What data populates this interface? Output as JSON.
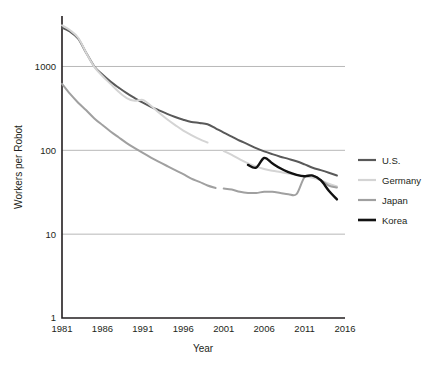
{
  "chart_data": {
    "type": "line",
    "title": "",
    "xlabel": "Year",
    "ylabel": "Workers per Robot",
    "xlim": [
      1981,
      2016
    ],
    "ylim": [
      1,
      4000
    ],
    "yscale": "log",
    "grid": "horizontal-only",
    "legend_position": "right",
    "xticks": [
      "1981",
      "1986",
      "1991",
      "1996",
      "2001",
      "2006",
      "2011",
      "2016"
    ],
    "xtick_values": [
      1981,
      1986,
      1991,
      1996,
      2001,
      2006,
      2011,
      2016
    ],
    "yticks": [
      "1",
      "10",
      "100",
      "1000"
    ],
    "ytick_values": [
      1,
      10,
      100,
      1000
    ],
    "series": [
      {
        "name": "U.S.",
        "color": "#595959",
        "width": 2.0,
        "points": [
          [
            1981,
            2900
          ],
          [
            1982,
            2600
          ],
          [
            1983,
            2150
          ],
          [
            1984,
            1450
          ],
          [
            1985,
            1000
          ],
          [
            1986,
            800
          ],
          [
            1987,
            660
          ],
          [
            1988,
            560
          ],
          [
            1989,
            480
          ],
          [
            1990,
            420
          ],
          [
            1991,
            370
          ],
          [
            1992,
            330
          ],
          [
            1993,
            300
          ],
          [
            1994,
            272
          ],
          [
            1995,
            250
          ],
          [
            1996,
            232
          ],
          [
            1997,
            218
          ],
          [
            1998,
            212
          ],
          [
            1999,
            205
          ],
          [
            2000,
            183
          ],
          [
            2001,
            163
          ],
          [
            2002,
            146
          ],
          [
            2003,
            130
          ],
          [
            2004,
            118
          ],
          [
            2005,
            106
          ],
          [
            2006,
            97
          ],
          [
            2007,
            90
          ],
          [
            2008,
            84
          ],
          [
            2009,
            79
          ],
          [
            2010,
            74
          ],
          [
            2011,
            68
          ],
          [
            2012,
            62
          ],
          [
            2013,
            58
          ],
          [
            2014,
            54
          ],
          [
            2015,
            50
          ]
        ]
      },
      {
        "name": "Germany",
        "color": "#d4d4d4",
        "width": 2.0,
        "segments": [
          [
            [
              1981,
              3100
            ],
            [
              1982,
              2700
            ],
            [
              1983,
              2200
            ],
            [
              1984,
              1450
            ],
            [
              1985,
              990
            ],
            [
              1986,
              770
            ],
            [
              1987,
              620
            ],
            [
              1988,
              500
            ],
            [
              1989,
              420
            ],
            [
              1990,
              390
            ],
            [
              1991,
              400
            ],
            [
              1992,
              340
            ],
            [
              1993,
              280
            ],
            [
              1994,
              235
            ],
            [
              1995,
              200
            ],
            [
              1996,
              172
            ],
            [
              1997,
              152
            ],
            [
              1998,
              136
            ],
            [
              1999,
              124
            ]
          ],
          [
            [
              2001,
              98
            ],
            [
              2002,
              88
            ],
            [
              2003,
              78
            ],
            [
              2004,
              70
            ],
            [
              2005,
              64
            ],
            [
              2006,
              60
            ],
            [
              2007,
              57
            ],
            [
              2008,
              55
            ],
            [
              2009,
              53
            ],
            [
              2010,
              51
            ],
            [
              2011,
              49
            ],
            [
              2012,
              47
            ],
            [
              2013,
              44
            ],
            [
              2014,
              40
            ],
            [
              2015,
              37
            ]
          ]
        ]
      },
      {
        "name": "Japan",
        "color": "#a0a0a0",
        "width": 2.0,
        "segments": [
          [
            [
              1981,
              620
            ],
            [
              1982,
              470
            ],
            [
              1983,
              370
            ],
            [
              1984,
              300
            ],
            [
              1985,
              240
            ],
            [
              1986,
              200
            ],
            [
              1987,
              168
            ],
            [
              1988,
              143
            ],
            [
              1989,
              122
            ],
            [
              1990,
              106
            ],
            [
              1991,
              93
            ],
            [
              1992,
              82
            ],
            [
              1993,
              73
            ],
            [
              1994,
              65
            ],
            [
              1995,
              58
            ],
            [
              1996,
              52
            ],
            [
              1997,
              46
            ],
            [
              1998,
              42
            ],
            [
              1999,
              38
            ],
            [
              2000,
              35.5
            ]
          ],
          [
            [
              2001,
              35
            ],
            [
              2002,
              34
            ],
            [
              2003,
              32
            ],
            [
              2004,
              31
            ],
            [
              2005,
              31
            ],
            [
              2006,
              32
            ],
            [
              2007,
              32
            ],
            [
              2008,
              31
            ],
            [
              2009,
              30
            ],
            [
              2010,
              30
            ],
            [
              2011,
              48
            ],
            [
              2012,
              50
            ],
            [
              2013,
              44
            ],
            [
              2014,
              38
            ],
            [
              2015,
              36
            ]
          ]
        ]
      },
      {
        "name": "Korea",
        "color": "#111111",
        "width": 2.4,
        "points": [
          [
            2004,
            67
          ],
          [
            2005,
            62
          ],
          [
            2006,
            81
          ],
          [
            2007,
            70
          ],
          [
            2008,
            61
          ],
          [
            2009,
            55
          ],
          [
            2010,
            51
          ],
          [
            2011,
            49
          ],
          [
            2012,
            50
          ],
          [
            2013,
            44
          ],
          [
            2014,
            33
          ],
          [
            2015,
            26
          ]
        ]
      }
    ]
  },
  "legend": {
    "items": [
      {
        "label": "U.S.",
        "color": "#595959"
      },
      {
        "label": "Germany",
        "color": "#d4d4d4"
      },
      {
        "label": "Japan",
        "color": "#a0a0a0"
      },
      {
        "label": "Korea",
        "color": "#111111"
      }
    ]
  }
}
